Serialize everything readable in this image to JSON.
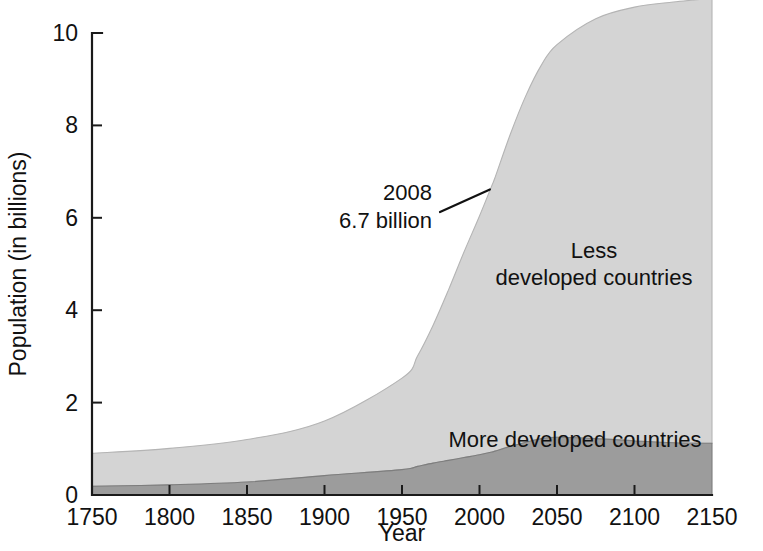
{
  "chart_data": {
    "type": "area",
    "title": "",
    "xlabel": "Year",
    "ylabel": "Population (in billions)",
    "xlim": [
      1750,
      2150
    ],
    "ylim": [
      0,
      10
    ],
    "grid": false,
    "stacked": true,
    "legend_position": "inline-labels",
    "x_ticks": [
      1750,
      1800,
      1850,
      1900,
      1950,
      2000,
      2050,
      2100,
      2150
    ],
    "y_ticks": [
      0,
      2,
      4,
      6,
      8,
      10
    ],
    "x": [
      1750,
      1800,
      1850,
      1900,
      1950,
      1960,
      1970,
      1980,
      1990,
      2000,
      2008,
      2010,
      2020,
      2030,
      2040,
      2050,
      2075,
      2100,
      2125,
      2150
    ],
    "series": [
      {
        "name": "More developed countries",
        "color": "#9c9c9c",
        "values": [
          0.19,
          0.22,
          0.28,
          0.42,
          0.55,
          0.62,
          0.69,
          0.75,
          0.81,
          0.87,
          0.93,
          0.95,
          1.05,
          1.14,
          1.22,
          1.25,
          1.22,
          1.17,
          1.13,
          1.12
        ]
      },
      {
        "name": "Less developed countries",
        "color": "#d4d4d4",
        "values": [
          0.71,
          0.79,
          0.92,
          1.18,
          1.98,
          2.39,
          2.98,
          3.69,
          4.45,
          5.17,
          5.77,
          5.92,
          6.77,
          7.51,
          8.09,
          8.5,
          9.09,
          9.39,
          9.54,
          9.63
        ]
      }
    ],
    "totals": [
      0.9,
      1.01,
      1.2,
      1.6,
      2.53,
      3.01,
      3.67,
      4.44,
      5.26,
      6.04,
      6.7,
      6.87,
      7.82,
      8.65,
      9.31,
      9.75,
      10.31,
      10.56,
      10.67,
      10.75
    ],
    "annotations": [
      {
        "name": "population-2008-callout",
        "line1": "2008",
        "line2": "6.7 billion",
        "target_x": 2008,
        "target_y": 6.7
      }
    ],
    "series_labels": [
      {
        "name": "less-developed-label",
        "line1": "Less",
        "line2": "developed countries"
      },
      {
        "name": "more-developed-label",
        "line1": "More developed countries",
        "line2": ""
      }
    ]
  },
  "colors": {
    "less_developed": "#d4d4d4",
    "more_developed": "#9c9c9c",
    "axis": "#1a1a1a",
    "text": "#111111",
    "background": "#ffffff"
  }
}
